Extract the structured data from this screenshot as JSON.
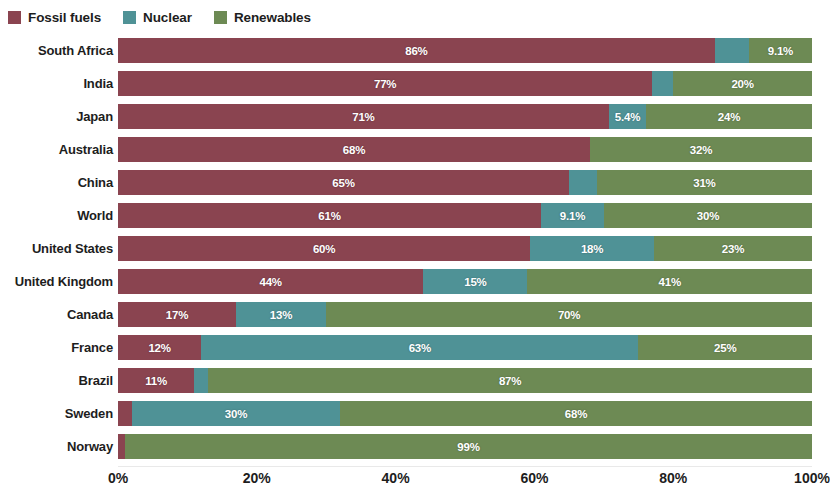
{
  "legend": {
    "position": "top-left",
    "items": [
      {
        "label": "Fossil fuels",
        "color": "#8a4450",
        "name": "fossil-fuels"
      },
      {
        "label": "Nuclear",
        "color": "#4f9296",
        "name": "nuclear"
      },
      {
        "label": "Renewables",
        "color": "#6d8a54",
        "name": "renewables"
      }
    ]
  },
  "axis": {
    "ticks": [
      "0%",
      "20%",
      "40%",
      "60%",
      "80%",
      "100%"
    ],
    "min": 0,
    "max": 100
  },
  "chart_data": {
    "type": "bar",
    "orientation": "horizontal",
    "stacked": true,
    "title": "",
    "xlabel": "",
    "ylabel": "",
    "xlim": [
      0,
      100
    ],
    "grid": false,
    "legend_position": "top-left",
    "categories": [
      "South Africa",
      "India",
      "Japan",
      "Australia",
      "China",
      "World",
      "United States",
      "United Kingdom",
      "Canada",
      "France",
      "Brazil",
      "Sweden",
      "Norway"
    ],
    "series": [
      {
        "name": "Fossil fuels",
        "color": "#8a4450",
        "values": [
          86,
          77,
          71,
          68,
          65,
          61,
          60,
          44,
          17,
          12,
          11,
          2,
          1
        ],
        "labels": [
          "86%",
          "77%",
          "71%",
          "68%",
          "65%",
          "61%",
          "60%",
          "44%",
          "17%",
          "12%",
          "11%",
          "",
          ""
        ]
      },
      {
        "name": "Nuclear",
        "color": "#4f9296",
        "values": [
          4.9,
          3,
          5.4,
          0,
          4,
          9.1,
          18,
          15,
          13,
          63,
          2,
          30,
          0
        ],
        "labels": [
          "",
          "",
          "5.4%",
          "",
          "",
          "9.1%",
          "18%",
          "15%",
          "13%",
          "63%",
          "",
          "30%",
          ""
        ]
      },
      {
        "name": "Renewables",
        "color": "#6d8a54",
        "values": [
          9.1,
          20,
          24,
          32,
          31,
          30,
          23,
          41,
          70,
          25,
          87,
          68,
          99
        ],
        "labels": [
          "9.1%",
          "20%",
          "24%",
          "32%",
          "31%",
          "30%",
          "23%",
          "41%",
          "70%",
          "25%",
          "87%",
          "68%",
          "99%"
        ]
      }
    ]
  }
}
